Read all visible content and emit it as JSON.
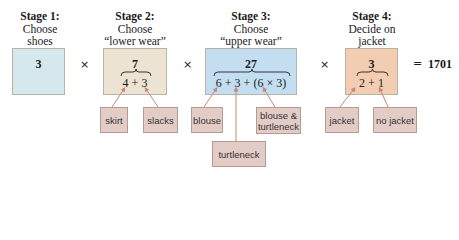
{
  "stages": [
    {
      "title": "Stage 1:",
      "line1": "Choose",
      "line2": "shoes",
      "total": "3",
      "expression": "",
      "color": "#d4e8ee"
    },
    {
      "title": "Stage 2:",
      "line1": "Choose",
      "line2": "“lower wear”",
      "total": "7",
      "expression": "4 + 3",
      "color": "#ece3d2"
    },
    {
      "title": "Stage 3:",
      "line1": "Choose",
      "line2": "“upper wear”",
      "total": "27",
      "expression": "6 + 3 + (6 × 3)",
      "color": "#c3def0"
    },
    {
      "title": "Stage 4:",
      "line1": "Decide on",
      "line2": "jacket",
      "total": "3",
      "expression": "2 + 1",
      "color": "#f2cdb1"
    }
  ],
  "operators": {
    "multiply": "×",
    "equals": "="
  },
  "result": "1701",
  "labels": {
    "skirt": "skirt",
    "slacks": "slacks",
    "blouse": "blouse",
    "turtleneck": "turtleneck",
    "blouse_turtleneck_1": "blouse &",
    "blouse_turtleneck_2": "turtleneck",
    "jacket": "jacket",
    "no_jacket": "no jacket"
  },
  "colors": {
    "label_fill": "#e3ccc6",
    "arrow": "#c9867a"
  }
}
